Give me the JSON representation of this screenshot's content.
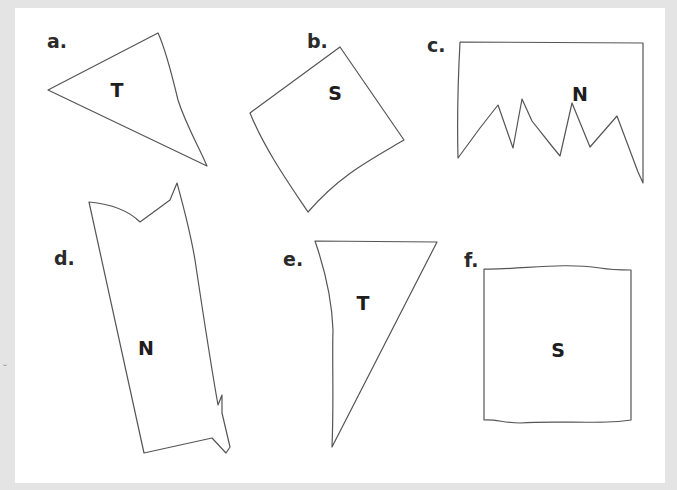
{
  "page": {
    "background_color": "#e4e4e4",
    "sheet_color": "#ffffff"
  },
  "items": [
    {
      "id": "a",
      "label": "a.",
      "label_pos": [
        47,
        32
      ],
      "letter": "T",
      "letter_pos": [
        117,
        90
      ],
      "shape": "triangle",
      "points": [
        [
          48,
          90
        ],
        [
          158,
          33
        ],
        [
          170,
          80
        ],
        [
          207,
          166
        ]
      ],
      "path": "M48,90 L158,33 C166,50 172,75 178,100 C186,125 198,145 207,166 Z",
      "stroke": "#555555"
    },
    {
      "id": "b",
      "label": "b.",
      "label_pos": [
        307,
        32
      ],
      "letter": "S",
      "letter_pos": [
        335,
        93
      ],
      "shape": "square",
      "path": "M250,113 L340,47 L404,140 C370,160 340,175 308,212 C290,185 265,150 250,113 Z",
      "stroke": "#555555"
    },
    {
      "id": "c",
      "label": "c.",
      "label_pos": [
        427,
        36
      ],
      "letter": "N",
      "letter_pos": [
        580,
        94
      ],
      "shape": "jagged-rectangle",
      "path": "M460,42 L643,43 L643,183 L638,172 L617,116 L590,147 L572,103 L560,156 L551,145 L532,121 L522,99 L513,148 L498,105 L480,128 L458,158 C457,120 458,80 460,42",
      "stroke": "#555555"
    },
    {
      "id": "d",
      "label": "d.",
      "label_pos": [
        54,
        249
      ],
      "letter": "N",
      "letter_pos": [
        146,
        348
      ],
      "shape": "jagged-rectangle",
      "path": "M89,202 C110,204 128,210 140,222 L170,200 L177,183 C183,205 190,230 195,260 C204,320 210,360 218,405 L222,395 L222,413 L230,447 L226,453 L212,438 L144,453 Z",
      "stroke": "#555555"
    },
    {
      "id": "e",
      "label": "e.",
      "label_pos": [
        283,
        250
      ],
      "letter": "T",
      "letter_pos": [
        363,
        303
      ],
      "shape": "triangle",
      "path": "M315,241 L437,242 L332,447 C334,400 332,360 333,330 C332,300 325,270 315,241 Z",
      "stroke": "#555555"
    },
    {
      "id": "f",
      "label": "f.",
      "label_pos": [
        464,
        251
      ],
      "letter": "S",
      "letter_pos": [
        558,
        350
      ],
      "shape": "square",
      "path": "M484,269 C520,270 560,262 600,268 C612,270 622,270 631,270 L631,420 C600,425 560,420 520,423 C505,423 495,419 484,420 Z",
      "stroke": "#555555"
    }
  ]
}
